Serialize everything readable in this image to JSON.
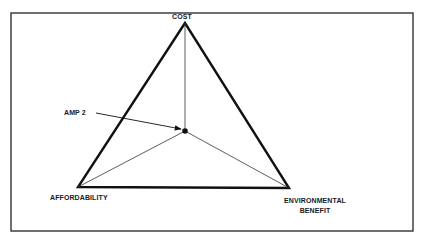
{
  "diagram": {
    "type": "triangle-tradeoff",
    "frame": {
      "stroke": "#222222"
    },
    "vertices": {
      "top": {
        "label": "COST",
        "x": 185,
        "y": 23
      },
      "left": {
        "label": "AFFORDABILITY",
        "x": 78,
        "y": 187
      },
      "right": {
        "label_line1": "ENVIRONMENTAL",
        "label_line2": "BENEFIT",
        "x": 289,
        "y": 188
      }
    },
    "point": {
      "label": "AMP 2",
      "x": 185,
      "y": 131
    },
    "colors": {
      "ink": "#111111",
      "thin": "#333333"
    }
  }
}
